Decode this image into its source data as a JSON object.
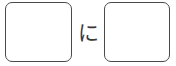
{
  "exercise": {
    "type": "fill-in-the-blank",
    "boxes": [
      {
        "id": "box-1",
        "value": "",
        "placeholder": ""
      },
      {
        "id": "box-2",
        "value": "",
        "placeholder": ""
      }
    ],
    "separator": {
      "text": "に",
      "romaji": "ni",
      "script": "hiragana",
      "role": "particle"
    },
    "colors": {
      "box_border": "#4a4a4a",
      "box_fill": "#ffffff",
      "text": "#3a3a3a",
      "background": "#ffffff"
    }
  }
}
